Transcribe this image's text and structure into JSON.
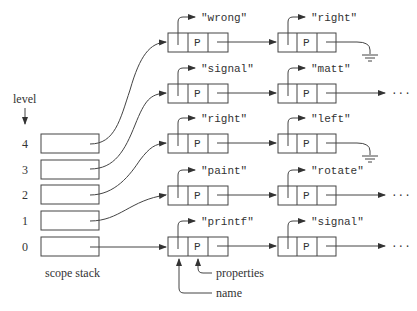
{
  "diagram": {
    "level_label": "level",
    "stack_label": "scope stack",
    "levels": [
      "4",
      "3",
      "2",
      "1",
      "0"
    ],
    "node_cell_label": "P",
    "rows": [
      {
        "first": "\"wrong\"",
        "second": "\"right\"",
        "end": "ground"
      },
      {
        "first": "\"signal\"",
        "second": "\"matt\"",
        "end": "continues"
      },
      {
        "first": "\"right\"",
        "second": "\"left\"",
        "end": "ground"
      },
      {
        "first": "\"paint\"",
        "second": "\"rotate\"",
        "end": "continues"
      },
      {
        "first": "\"printf\"",
        "second": "\"signal\"",
        "end": "continues"
      }
    ],
    "ellipsis": "···",
    "annotations": {
      "properties": "properties",
      "name": "name"
    }
  }
}
